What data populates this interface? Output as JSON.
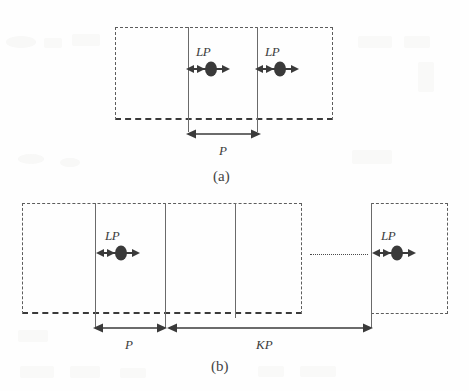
{
  "figure": {
    "background_color": "#fefefe",
    "ink_color": "#4a4a4a",
    "marker_color": "#3a3a3a"
  },
  "panel_a": {
    "caption": "(a)",
    "labels": {
      "lp_left": "LP",
      "lp_right": "LP",
      "period": "P"
    },
    "markers": [
      {
        "name": "lp-element-1",
        "label": "LP"
      },
      {
        "name": "lp-element-2",
        "label": "LP"
      }
    ],
    "dimensions": [
      {
        "name": "period-P",
        "label": "P"
      }
    ]
  },
  "panel_b": {
    "caption": "(b)",
    "labels": {
      "lp_left": "LP",
      "lp_right": "LP",
      "period": "P",
      "span": "KP"
    },
    "markers": [
      {
        "name": "lp-element-1",
        "label": "LP"
      },
      {
        "name": "lp-element-last",
        "label": "LP"
      }
    ],
    "dimensions": [
      {
        "name": "period-P",
        "label": "P"
      },
      {
        "name": "span-KP",
        "label": "KP"
      }
    ],
    "continuation": "…"
  }
}
